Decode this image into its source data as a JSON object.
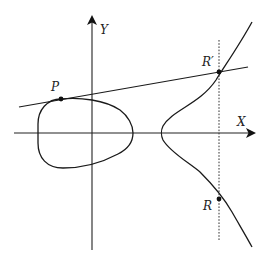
{
  "figure": {
    "axes": {
      "x_label": "X",
      "y_label": "Y"
    },
    "points": [
      {
        "id": "P",
        "label": "P",
        "description": "tangent point on the oval component"
      },
      {
        "id": "R_prime",
        "label": "R′",
        "description": "third intersection of tangent line with the curve"
      },
      {
        "id": "R",
        "label": "R",
        "description": "reflection of R′ across the X axis"
      }
    ],
    "elements": {
      "curve_components": [
        "closed oval (egg)",
        "unbounded right branch"
      ],
      "tangent_line": "line through P tangent to the oval, meeting curve again at R′",
      "vertical_line": "dotted vertical line through R′ and R"
    },
    "colors": {
      "stroke": "#1a1a1a",
      "background": "#ffffff"
    }
  }
}
